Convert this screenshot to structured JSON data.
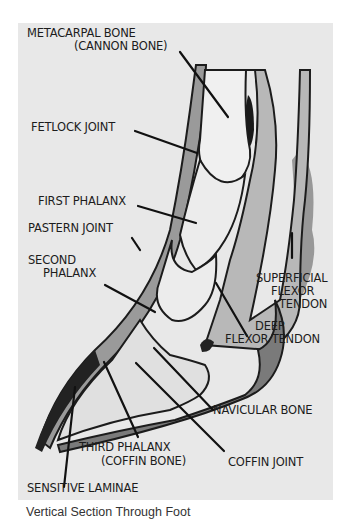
{
  "diagram": {
    "title": "Vertical Section Through Foot",
    "labels": {
      "metacarpal": {
        "line1": "METACARPAL BONE",
        "line2": "(CANNON BONE)"
      },
      "fetlock": "FETLOCK JOINT",
      "first_phalanx": "FIRST PHALANX",
      "pastern": "PASTERN JOINT",
      "second_phalanx": {
        "line1": "SECOND",
        "line2": "PHALANX"
      },
      "superficial": {
        "line1": "SUPERFICIAL",
        "line2": "FLEXOR",
        "line3": "TENDON"
      },
      "deep": {
        "line1": "DEEP",
        "line2": "FLEXOR TENDON"
      },
      "navicular": "NAVICULAR BONE",
      "third_phalanx": {
        "line1": "THIRD PHALANX",
        "line2": "(COFFIN BONE)"
      },
      "coffin_joint": "COFFIN JOINT",
      "sensitive_laminae": "SENSITIVE LAMINAE"
    },
    "colors": {
      "panel": "#e8e8e8",
      "ink": "#1c1c1c",
      "tissue_mid": "#9a9a9a",
      "tissue_dark": "#6e6e6e",
      "bone": "#ececec"
    }
  }
}
